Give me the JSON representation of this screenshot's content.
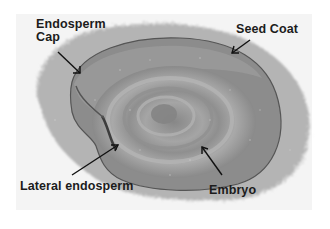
{
  "figure": {
    "type": "annotated-micrograph",
    "labels": {
      "endosperm_cap_line1": "Endosperm",
      "endosperm_cap_line2": "Cap",
      "seed_coat": "Seed Coat",
      "lateral_endosperm": "Lateral endosperm",
      "embryo": "Embryo"
    },
    "colors": {
      "background": "#ffffff",
      "photo_background": "#f4f4f4",
      "halo": "#a9a9a9",
      "seed_outer": "#8a8a8a",
      "seed_inner": "#9c9c9c",
      "ring_light": "#b0b0b0",
      "ring_dark": "#7d7d7d",
      "label_text": "#1c1c1c"
    }
  }
}
